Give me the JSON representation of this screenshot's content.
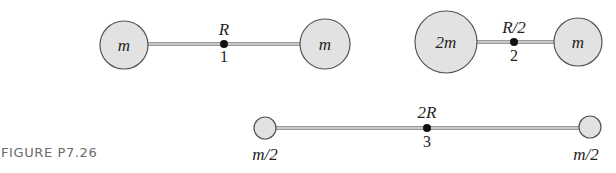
{
  "figure": {
    "caption": "FIGURE P7.26",
    "colors": {
      "mass_fill": "#e2e2e2",
      "mass_stroke": "#555555",
      "rod": "#9a9a9a",
      "pivot": "#111111"
    }
  },
  "systems": [
    {
      "id": "1",
      "number_label": "1",
      "rod_label": "R",
      "left_mass": "m",
      "right_mass": "m"
    },
    {
      "id": "2",
      "number_label": "2",
      "rod_label": "R/2",
      "left_mass": "2m",
      "right_mass": "m"
    },
    {
      "id": "3",
      "number_label": "3",
      "rod_label": "2R",
      "left_mass": "m/2",
      "right_mass": "m/2"
    }
  ]
}
